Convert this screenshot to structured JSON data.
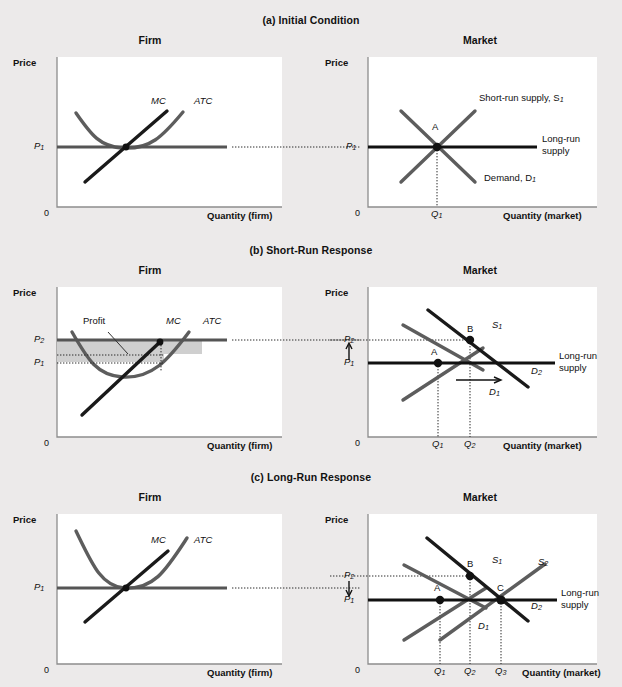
{
  "figure": {
    "background": "#eceaea",
    "panels": [
      {
        "id": "a",
        "title": "(a) Initial Condition",
        "firm": {
          "heading": "Firm",
          "y_axis_label": "Price",
          "x_axis_label": "Quantity (firm)",
          "origin": "0",
          "price_labels": [
            "P1"
          ],
          "curves": [
            "MC",
            "ATC"
          ],
          "mc_label": "MC",
          "atc_label": "ATC"
        },
        "market": {
          "heading": "Market",
          "y_axis_label": "Price",
          "x_axis_label": "Quantity (market)",
          "origin": "0",
          "price_labels": [
            "P1"
          ],
          "quantity_labels": [
            "Q1"
          ],
          "supply_label": "Short-run supply, S",
          "supply_sub": "1",
          "demand_label": "Demand, D",
          "demand_sub": "1",
          "longrun_label_line1": "Long-run",
          "longrun_label_line2": "supply",
          "points": [
            "A"
          ]
        }
      },
      {
        "id": "b",
        "title": "(b) Short-Run Response",
        "firm": {
          "heading": "Firm",
          "y_axis_label": "Price",
          "x_axis_label": "Quantity (firm)",
          "origin": "0",
          "price_labels": [
            "P2",
            "P1"
          ],
          "profit_label": "Profit",
          "mc_label": "MC",
          "atc_label": "ATC"
        },
        "market": {
          "heading": "Market",
          "y_axis_label": "Price",
          "x_axis_label": "Quantity (market)",
          "origin": "0",
          "price_labels": [
            "P2",
            "P1"
          ],
          "quantity_labels": [
            "Q1",
            "Q2"
          ],
          "supply_label": "S",
          "supply_sub": "1",
          "demand1_label": "D",
          "demand1_sub": "1",
          "demand2_label": "D",
          "demand2_sub": "2",
          "longrun_label_line1": "Long-run",
          "longrun_label_line2": "supply",
          "points": [
            "A",
            "B"
          ],
          "price_arrow": "up",
          "demand_shift_arrow": "right"
        }
      },
      {
        "id": "c",
        "title": "(c) Long-Run Response",
        "firm": {
          "heading": "Firm",
          "y_axis_label": "Price",
          "x_axis_label": "Quantity (firm)",
          "origin": "0",
          "price_labels": [
            "P1"
          ],
          "mc_label": "MC",
          "atc_label": "ATC"
        },
        "market": {
          "heading": "Market",
          "y_axis_label": "Price",
          "x_axis_label": "Quantity (market)",
          "origin": "0",
          "price_labels": [
            "P2",
            "P1"
          ],
          "quantity_labels": [
            "Q1",
            "Q2",
            "Q3"
          ],
          "supply1_label": "S",
          "supply1_sub": "1",
          "supply2_label": "S",
          "supply2_sub": "2",
          "demand1_label": "D",
          "demand1_sub": "1",
          "demand2_label": "D",
          "demand2_sub": "2",
          "longrun_label_line1": "Long-run",
          "longrun_label_line2": "supply",
          "points": [
            "A",
            "B",
            "C"
          ],
          "price_arrow": "down"
        }
      }
    ],
    "colors": {
      "black_curve": "#1a1a1a",
      "gray_curve": "#5d5d5d",
      "profit_fill": "#cfcfcf",
      "plot_bg": "#ffffff",
      "page_bg": "#eceaea",
      "axis": "#8d8d8d"
    }
  }
}
